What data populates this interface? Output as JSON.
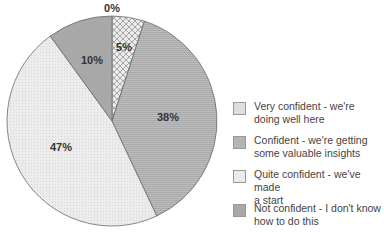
{
  "chart_data": {
    "type": "pie",
    "title": "",
    "categories": [
      "Very confident - we're doing well here",
      "Confident - we're getting some valuable insights",
      "Quite confident - we've made a start",
      "Not confident - I don't know how to do this"
    ],
    "values": [
      5,
      38,
      47,
      10
    ],
    "extra_labels": [
      "0%"
    ],
    "data_labels": [
      "5%",
      "38%",
      "47%",
      "10%"
    ],
    "colors": [
      "#e6e6e6",
      "#b3b3b3",
      "#e9e9e9",
      "#a6a6a6"
    ],
    "patterns": [
      "crosshatch",
      "horizontal-lines",
      "dots",
      "diagonal-lines"
    ],
    "legend_position": "right",
    "start_angle": "12 o'clock, clockwise"
  },
  "labels": {
    "zero": "0%",
    "s0": "5%",
    "s1": "38%",
    "s2": "47%",
    "s3": "10%"
  },
  "legend": [
    {
      "line1": "Very confident - we're",
      "line2": "doing well here"
    },
    {
      "line1": "Confident - we're getting",
      "line2": "some valuable insights"
    },
    {
      "line1": "Quite confident - we've made",
      "line2": "a start"
    },
    {
      "line1": "Not confident - I don't know",
      "line2": "how to do this"
    }
  ]
}
